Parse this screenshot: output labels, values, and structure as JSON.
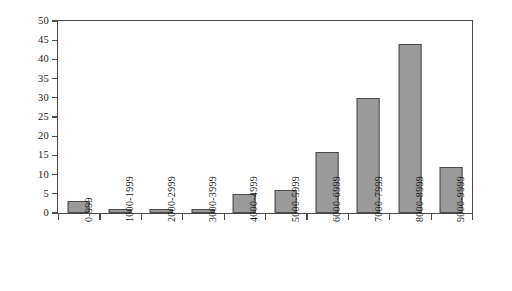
{
  "chart_data": {
    "type": "bar",
    "title": "",
    "subtitle": "",
    "xlabel": "",
    "ylabel": "",
    "categories": [
      "0-999",
      "1000-1999",
      "2000-2999",
      "3000-3999",
      "4000-4999",
      "5000-5999",
      "6000-6999",
      "7000-7999",
      "8000-8999",
      "9000-9999"
    ],
    "values": [
      3,
      1,
      1,
      1,
      5,
      6,
      16,
      30,
      44,
      12
    ],
    "ylim": [
      0,
      50
    ],
    "ytick_values": [
      0,
      5,
      10,
      15,
      20,
      25,
      30,
      35,
      40,
      45,
      50
    ],
    "ytick_labels": [
      "0",
      "5",
      "10",
      "15",
      "20",
      "25",
      "30",
      "35",
      "40",
      "45",
      "50"
    ],
    "grid": false,
    "legend": null,
    "legend_position": "none",
    "annotations": [],
    "bar_fill_color": "#9a9a9a",
    "bar_edge_color": "#4a4a4a",
    "axis_color": "#4a4a4a",
    "background_color": "#ffffff"
  }
}
